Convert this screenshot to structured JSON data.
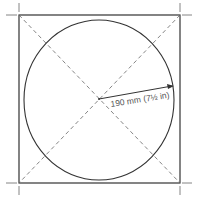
{
  "diagram": {
    "radius_label": "190 mm (7½ in)",
    "colors": {
      "line": "#333333",
      "dashed": "#666666",
      "text": "#555555"
    }
  }
}
